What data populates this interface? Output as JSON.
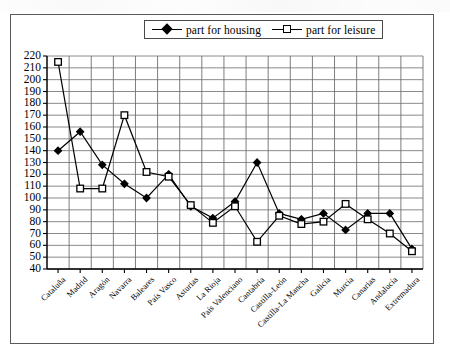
{
  "chart_data": {
    "type": "line",
    "title": "",
    "subtitle": "",
    "xlabel": "",
    "ylabel": "",
    "ylim": [
      40,
      220
    ],
    "ytick_step": 10,
    "yticks": [
      220,
      210,
      200,
      190,
      180,
      170,
      160,
      150,
      140,
      130,
      120,
      110,
      100,
      90,
      80,
      70,
      60,
      50,
      40
    ],
    "grid": true,
    "legend_position": "top-center",
    "categories": [
      "Cataluña",
      "Madrid",
      "Aragón",
      "Navarra",
      "Baleares",
      "País Vasco",
      "Asturias",
      "La Rioja",
      "País Valenciano",
      "Cantabria",
      "Castilla-León",
      "Castilla-La Mancha",
      "Galicia",
      "Murcia",
      "Canarias",
      "Andalucía",
      "Extremadura"
    ],
    "series": [
      {
        "name": "part for housing",
        "marker": "diamond-filled",
        "color": "#000000",
        "values": [
          140,
          156,
          128,
          112,
          100,
          120,
          93,
          83,
          97,
          130,
          87,
          82,
          87,
          73,
          87,
          87,
          57
        ]
      },
      {
        "name": "part for leisure",
        "marker": "square-open",
        "color": "#000000",
        "values": [
          215,
          108,
          108,
          170,
          122,
          118,
          94,
          79,
          93,
          63,
          85,
          78,
          80,
          95,
          82,
          70,
          55
        ]
      }
    ]
  },
  "legend": {
    "items": [
      {
        "label": "part for housing",
        "marker": "diamond-filled"
      },
      {
        "label": "part for leisure",
        "marker": "square-open"
      }
    ]
  }
}
